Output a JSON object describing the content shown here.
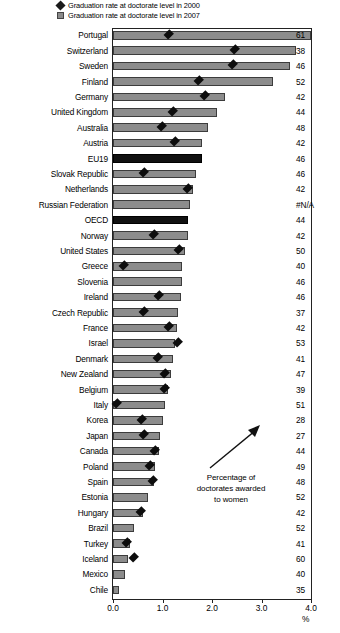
{
  "legend": {
    "items": [
      {
        "marker": "diamond-marker",
        "label": "Graduation rate at doctorate level  in 2000"
      },
      {
        "marker": "square-swatch",
        "label": "Graduation rate at doctorate level  in 2007"
      }
    ]
  },
  "annotation": {
    "text": "Percentage of doctorates awarded to women",
    "line1": "Percentage of",
    "line2": "doctorates awarded",
    "line3": "to women",
    "arrow": "arrow-up-right-icon"
  },
  "axis": {
    "unit": "%",
    "ticks": [
      "0.0",
      "1.0",
      "2.0",
      "3.0",
      "4.0"
    ],
    "min": 0.0,
    "max": 4.0
  },
  "colors": {
    "bar_2007": "#8c8c8c",
    "bar_highlight": "#111111",
    "marker_2000": "#0d0d0d",
    "frame": "#222222"
  },
  "chart_data": {
    "type": "bar",
    "title": "",
    "xlabel": "%",
    "ylabel": "",
    "xlim": [
      0.0,
      4.0
    ],
    "grid": false,
    "orientation": "horizontal",
    "legend_position": "top",
    "categories": [
      "Portugal",
      "Switzerland",
      "Sweden",
      "Finland",
      "Germany",
      "United Kingdom",
      "Australia",
      "Austria",
      "EU19",
      "Slovak Republic",
      "Netherlands",
      "Russian Federation",
      "OECD",
      "Norway",
      "United States",
      "Greece",
      "Slovenia",
      "Ireland",
      "Czech Republic",
      "France",
      "Israel",
      "Denmark",
      "New Zealand",
      "Belgium",
      "Italy",
      "Korea",
      "Japan",
      "Canada",
      "Poland",
      "Spain",
      "Estonia",
      "Hungary",
      "Brazil",
      "Turkey",
      "Iceland",
      "Mexico",
      "Chile"
    ],
    "series": [
      {
        "name": "Graduation rate at doctorate level  in 2007",
        "values": [
          4.0,
          3.7,
          3.58,
          3.23,
          2.27,
          2.1,
          1.92,
          1.8,
          1.8,
          1.68,
          1.62,
          1.55,
          1.52,
          1.52,
          1.45,
          1.4,
          1.4,
          1.37,
          1.32,
          1.3,
          1.25,
          1.22,
          1.18,
          1.12,
          1.05,
          1.0,
          0.95,
          0.92,
          0.85,
          0.82,
          0.7,
          0.6,
          0.42,
          0.35,
          0.3,
          0.25,
          0.12
        ]
      },
      {
        "name": "Graduation rate at doctorate level  in 2000",
        "values": [
          1.13,
          2.45,
          2.42,
          1.73,
          1.85,
          1.2,
          0.98,
          1.25,
          null,
          0.62,
          1.5,
          null,
          null,
          0.82,
          1.32,
          0.22,
          null,
          0.92,
          0.62,
          1.12,
          1.3,
          0.9,
          1.05,
          1.05,
          0.08,
          0.57,
          0.62,
          0.85,
          0.75,
          0.8,
          null,
          0.55,
          null,
          0.28,
          0.42,
          null,
          null
        ]
      }
    ],
    "data_labels": {
      "name": "Percentage of doctorates awarded to women",
      "values": [
        "61",
        "38",
        "46",
        "52",
        "42",
        "44",
        "48",
        "42",
        "46",
        "46",
        "42",
        "#N/A",
        "44",
        "42",
        "50",
        "40",
        "46",
        "46",
        "37",
        "42",
        "53",
        "41",
        "47",
        "39",
        "51",
        "28",
        "27",
        "44",
        "49",
        "48",
        "52",
        "42",
        "52",
        "41",
        "60",
        "40",
        "35"
      ]
    },
    "highlighted_categories": [
      "EU19",
      "OECD"
    ]
  }
}
